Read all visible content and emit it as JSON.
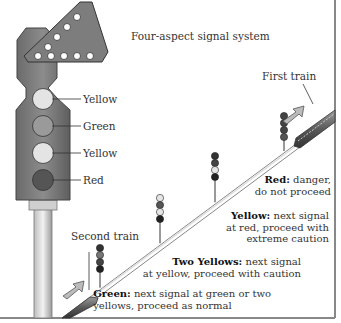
{
  "title": "Four-aspect signal system",
  "main_signal": {
    "lamps": [
      {
        "label": "Yellow",
        "color": "#e4e4e4"
      },
      {
        "label": "Green",
        "color": "#9a9a9a"
      },
      {
        "label": "Yellow",
        "color": "#e4e4e4"
      },
      {
        "label": "Red",
        "color": "#555555"
      }
    ]
  },
  "trains": {
    "first": "First train",
    "second": "Second train"
  },
  "aspects": [
    {
      "name": "Red:",
      "desc_lines": [
        "danger,",
        "do not proceed"
      ]
    },
    {
      "name": "Yellow:",
      "desc_lines": [
        "next signal",
        "at red, proceed with",
        "extreme caution"
      ]
    },
    {
      "name": "Two Yellows:",
      "desc_lines": [
        "next signal",
        "at yellow, proceed with caution"
      ]
    },
    {
      "name": "Green:",
      "desc_lines": [
        "next signal at green or two",
        "yellows, proceed as normal"
      ]
    }
  ],
  "colors": {
    "signal_body": "#7a7a7a",
    "signal_dark": "#4a4a4a",
    "lamp_off": "#3a3a3a",
    "lamp_on_light": "#e6e6e6",
    "frame": "#888888"
  }
}
